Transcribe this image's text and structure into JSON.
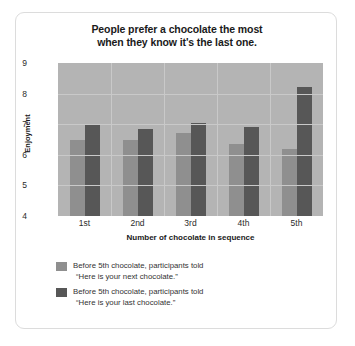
{
  "chart_data": {
    "type": "bar",
    "title": "People prefer a chocolate the most when they know it's the last one.",
    "title_line1": "People prefer a chocolate the most",
    "title_line2": "when they know it's the last one.",
    "xlabel": "Number of chocolate in sequence",
    "ylabel": "Enjoyment",
    "categories": [
      "1st",
      "2nd",
      "3rd",
      "4th",
      "5th"
    ],
    "ylim": [
      4,
      9
    ],
    "yticks": [
      9,
      8,
      7,
      6,
      5,
      4
    ],
    "grid": true,
    "legend_position": "bottom-left",
    "series": [
      {
        "name": "Before 5th chocolate, participants told \"Here is your next chocolate.\"",
        "legend_line1": "Before 5th chocolate, participants told",
        "legend_line2": "“Here is your next chocolate.”",
        "color": "#8f8f8f",
        "values": [
          6.5,
          6.5,
          6.7,
          6.35,
          6.2
        ]
      },
      {
        "name": "Before 5th chocolate, participants told \"Here is your last chocolate.\"",
        "legend_line1": "Before 5th chocolate, participants told",
        "legend_line2": "“Here is your last chocolate.”",
        "color": "#575757",
        "values": [
          7.0,
          6.85,
          7.05,
          6.9,
          8.2
        ]
      }
    ],
    "plot_background": "#b4b4b4",
    "gridline_color": "#c9c9c9"
  }
}
